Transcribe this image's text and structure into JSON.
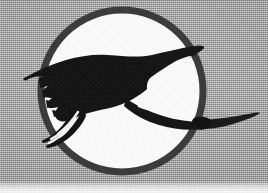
{
  "image": {
    "kind": "scanned-logo",
    "subject": "flying crane bird in circle emblem",
    "width": 268,
    "height": 193,
    "alt_text": "Black silhouette of a flying crane with outstretched wings, long neck and trailing legs, enclosed in a dark circular ring on a gray halftoned background"
  },
  "colors": {
    "background_gray": "#a9a9a9",
    "background_light_band": "#e8e8e8",
    "disc_fill": "#fbfbfb",
    "ring_stroke": "#3a3a3a",
    "bird_fill": "#111111",
    "bird_highlight": "#f4f4f4"
  },
  "emblem": {
    "ring": {
      "center_x": 122,
      "center_y": 91,
      "radius": 81,
      "stroke_width": 7
    },
    "bird": {
      "name": "crane-silhouette",
      "wing_span_label": "outstretched",
      "facing": "right"
    }
  },
  "labels": {
    "emblem_name": "crane-emblem",
    "disc_name": "emblem-disc",
    "ring_name": "emblem-ring",
    "bird_name": "crane-bird-silhouette"
  }
}
